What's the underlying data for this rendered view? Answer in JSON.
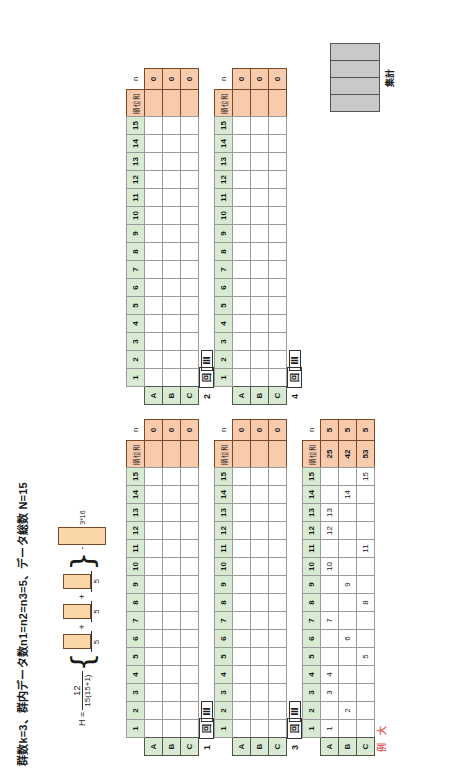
{
  "document": {
    "title": "群数k=3、群内データ数n1=n2=n3=5、データ総数 N=15",
    "language": "ja"
  },
  "formula": {
    "lhs": "H =",
    "coef_num": "12",
    "coef_den": "15(15+1)",
    "brace_open": "{",
    "brace_close": "}",
    "plus": "+",
    "term_den": "5",
    "tail": "3*16",
    "minus": "-"
  },
  "aggregate_block": {
    "label": "集計",
    "cells": 4,
    "color": "#c9c9c7"
  },
  "rank_tables": {
    "column_headers": [
      "1",
      "2",
      "3",
      "4",
      "5",
      "6",
      "7",
      "8",
      "9",
      "10",
      "11",
      "12",
      "13",
      "14",
      "15"
    ],
    "sum_header": "順位和",
    "n_header": "n",
    "row_labels": [
      "A",
      "B",
      "C"
    ],
    "group_numbers": [
      "1",
      "2",
      "3",
      "4"
    ],
    "group_roman": [
      "回",
      "Ⅲ"
    ],
    "blank_tables": [
      {
        "id": "1",
        "rows": [
          {
            "label": "A",
            "values": [
              "",
              "",
              "",
              "",
              "",
              "",
              "",
              "",
              "",
              "",
              "",
              "",
              "",
              "",
              ""
            ],
            "sum": "",
            "n": "0"
          },
          {
            "label": "B",
            "values": [
              "",
              "",
              "",
              "",
              "",
              "",
              "",
              "",
              "",
              "",
              "",
              "",
              "",
              "",
              ""
            ],
            "sum": "",
            "n": "0"
          },
          {
            "label": "C",
            "values": [
              "",
              "",
              "",
              "",
              "",
              "",
              "",
              "",
              "",
              "",
              "",
              "",
              "",
              "",
              ""
            ],
            "sum": "",
            "n": "0"
          }
        ]
      },
      {
        "id": "2",
        "rows": [
          {
            "label": "A",
            "values": [
              "",
              "",
              "",
              "",
              "",
              "",
              "",
              "",
              "",
              "",
              "",
              "",
              "",
              "",
              ""
            ],
            "sum": "",
            "n": "0"
          },
          {
            "label": "B",
            "values": [
              "",
              "",
              "",
              "",
              "",
              "",
              "",
              "",
              "",
              "",
              "",
              "",
              "",
              "",
              ""
            ],
            "sum": "",
            "n": "0"
          },
          {
            "label": "C",
            "values": [
              "",
              "",
              "",
              "",
              "",
              "",
              "",
              "",
              "",
              "",
              "",
              "",
              "",
              "",
              ""
            ],
            "sum": "",
            "n": "0"
          }
        ]
      },
      {
        "id": "3",
        "rows": [
          {
            "label": "A",
            "values": [
              "",
              "",
              "",
              "",
              "",
              "",
              "",
              "",
              "",
              "",
              "",
              "",
              "",
              "",
              ""
            ],
            "sum": "",
            "n": "0"
          },
          {
            "label": "B",
            "values": [
              "",
              "",
              "",
              "",
              "",
              "",
              "",
              "",
              "",
              "",
              "",
              "",
              "",
              "",
              ""
            ],
            "sum": "",
            "n": "0"
          },
          {
            "label": "C",
            "values": [
              "",
              "",
              "",
              "",
              "",
              "",
              "",
              "",
              "",
              "",
              "",
              "",
              "",
              "",
              ""
            ],
            "sum": "",
            "n": "0"
          }
        ]
      },
      {
        "id": "4",
        "rows": [
          {
            "label": "A",
            "values": [
              "",
              "",
              "",
              "",
              "",
              "",
              "",
              "",
              "",
              "",
              "",
              "",
              "",
              "",
              ""
            ],
            "sum": "",
            "n": "0"
          },
          {
            "label": "B",
            "values": [
              "",
              "",
              "",
              "",
              "",
              "",
              "",
              "",
              "",
              "",
              "",
              "",
              "",
              "",
              ""
            ],
            "sum": "",
            "n": "0"
          },
          {
            "label": "C",
            "values": [
              "",
              "",
              "",
              "",
              "",
              "",
              "",
              "",
              "",
              "",
              "",
              "",
              "",
              "",
              ""
            ],
            "sum": "",
            "n": "0"
          }
        ]
      }
    ],
    "example_table": {
      "label_line1": "例",
      "label_line2": "大",
      "status_badge": "OK",
      "rows": [
        {
          "label": "A",
          "values": [
            "1",
            "",
            "3",
            "4",
            "",
            "",
            "7",
            "",
            "",
            "10",
            "",
            "12",
            "13",
            "",
            ""
          ],
          "sum": "25",
          "n": "5"
        },
        {
          "label": "B",
          "values": [
            "",
            "2",
            "",
            "",
            "",
            "6",
            "",
            "",
            "9",
            "",
            "",
            "",
            "",
            "14",
            ""
          ],
          "sum": "42",
          "n": "5"
        },
        {
          "label": "C",
          "values": [
            "",
            "",
            "",
            "",
            "5",
            "",
            "",
            "8",
            "",
            "",
            "11",
            "",
            "",
            "",
            "15"
          ],
          "sum": "53",
          "n": "5"
        }
      ]
    }
  }
}
